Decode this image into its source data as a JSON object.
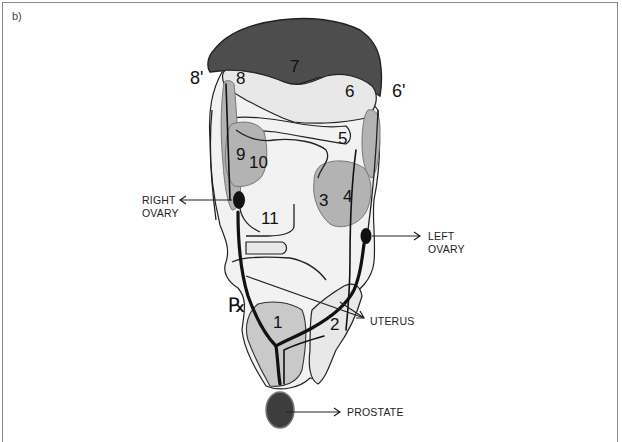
{
  "figure": {
    "panel_label": "b)",
    "colors": {
      "dark_region": "#4d4d4d",
      "mid_region": "#b3b3b3",
      "light_region": "#e8e8e8",
      "outline": "#222222",
      "prostate": "#3d3d3d"
    },
    "region_numbers": [
      "1",
      "2",
      "3",
      "4",
      "5",
      "6",
      "7",
      "8",
      "9",
      "10",
      "11"
    ],
    "outer_labels": {
      "left": "8'",
      "right": "6'"
    },
    "symbol": "℞",
    "callouts": {
      "right_ovary": [
        "RIGHT",
        "OVARY"
      ],
      "left_ovary": [
        "LEFT",
        "OVARY"
      ],
      "uterus": "UTERUS",
      "prostate": "PROSTATE"
    }
  }
}
